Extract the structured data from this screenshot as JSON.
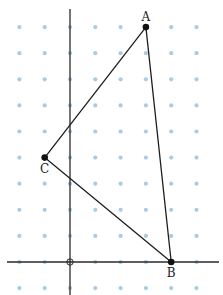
{
  "diagram": {
    "grid": {
      "x_range": [
        -2,
        5
      ],
      "y_range": [
        -1,
        9
      ],
      "dot_color": "#a8cde3",
      "origin_px": [
        70,
        262
      ],
      "unit_px": [
        25.3,
        26.1
      ]
    },
    "axes": {
      "color": "#2a2a2a",
      "origin_marker": "open-circle"
    },
    "triangle": {
      "line_color": "#1e1e1e",
      "vertices": [
        {
          "label": "A",
          "x": 3,
          "y": 9,
          "label_pos": "above"
        },
        {
          "label": "B",
          "x": 4,
          "y": 0,
          "label_pos": "below"
        },
        {
          "label": "C",
          "x": -1,
          "y": 4,
          "label_pos": "below"
        }
      ]
    }
  }
}
